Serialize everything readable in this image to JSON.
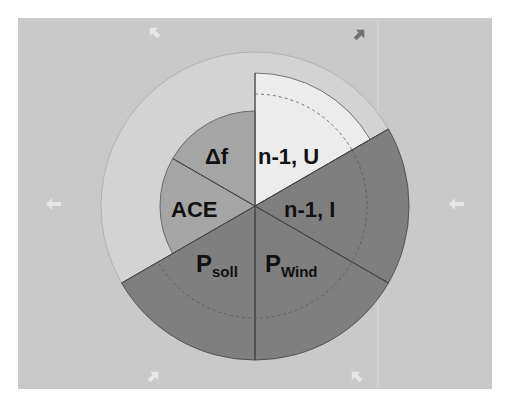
{
  "diagram": {
    "type": "sector-wheel",
    "colors": {
      "panel": "#c9c9c9",
      "outer_ring_fill": "#d4d4d4",
      "outer_ring_stroke": "#b0b0b0",
      "light_sector": "#ececec",
      "mid_sector": "#a5a5a5",
      "dark_sector": "#7f7f7f",
      "divider": "#444444",
      "dashed": "#555555",
      "arrow_light": "#e6e6e6",
      "arrow_dark": "#707070",
      "text": "#111111"
    },
    "sectors": [
      {
        "id": "n1u",
        "label": "n-1, U",
        "sub": "",
        "tone": "light"
      },
      {
        "id": "n1i",
        "label": "n-1, I",
        "sub": "",
        "tone": "dark"
      },
      {
        "id": "pwind",
        "label": "P",
        "sub": "Wind",
        "tone": "dark"
      },
      {
        "id": "psoll",
        "label": "P",
        "sub": "soll",
        "tone": "dark"
      },
      {
        "id": "ace",
        "label": "ACE",
        "sub": "",
        "tone": "mid"
      },
      {
        "id": "df",
        "label": "Δf",
        "sub": "",
        "tone": "mid"
      }
    ],
    "arrows": [
      {
        "position": "top-left",
        "direction": "up-left",
        "tone": "light"
      },
      {
        "position": "top-right",
        "direction": "up-right",
        "tone": "dark"
      },
      {
        "position": "left",
        "direction": "left",
        "tone": "light"
      },
      {
        "position": "right",
        "direction": "left",
        "tone": "light"
      },
      {
        "position": "bottom-left",
        "direction": "up-right",
        "tone": "light"
      },
      {
        "position": "bottom-right",
        "direction": "up-left",
        "tone": "light"
      }
    ]
  }
}
